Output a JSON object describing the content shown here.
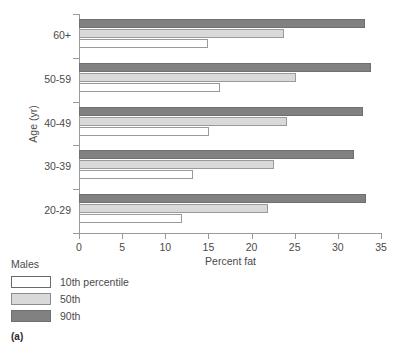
{
  "caption": "(a)",
  "chart_data": {
    "type": "bar",
    "orientation": "horizontal",
    "title": "",
    "xlabel": "Percent fat",
    "ylabel": "Age (yr)",
    "categories": [
      "20-29",
      "30-39",
      "40-49",
      "50-59",
      "60+"
    ],
    "xlim": [
      0,
      35
    ],
    "xticks": [
      0,
      5,
      10,
      15,
      20,
      25,
      30,
      35
    ],
    "xtick_labels": [
      "0",
      "5",
      "10",
      "15",
      "20",
      "25",
      "30",
      "35"
    ],
    "grid": false,
    "legend_position": "below-left",
    "legend_title": "Males",
    "series": [
      {
        "name": "10th percentile",
        "color": "#ffffff",
        "values": [
          11.9,
          13.2,
          15.1,
          16.3,
          15.0
        ]
      },
      {
        "name": "50th",
        "color": "#d9d9d9",
        "values": [
          21.9,
          22.6,
          24.1,
          25.2,
          23.8
        ]
      },
      {
        "name": "90th",
        "color": "#818181",
        "values": [
          33.3,
          31.9,
          32.9,
          33.8,
          33.2
        ]
      }
    ]
  },
  "legend": {
    "title": "Males",
    "items": [
      {
        "label": "10th percentile",
        "swatch": "p10"
      },
      {
        "label": "50th",
        "swatch": "p50"
      },
      {
        "label": "90th",
        "swatch": "p90"
      }
    ]
  }
}
